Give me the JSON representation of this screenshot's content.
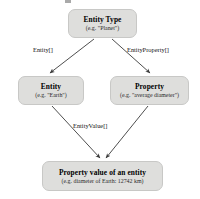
{
  "diagram": {
    "type": "flow-diagram",
    "background_color": "#ffffff",
    "node_fill_color": "#dededc",
    "node_border_color": "#c8c8c6",
    "edge_color": "#3a3a3a",
    "nodes": [
      {
        "id": "entity-type",
        "title": "Entity Type",
        "subtitle": "(e.g. \"Planet\")"
      },
      {
        "id": "entity",
        "title": "Entity",
        "subtitle": "(e.g. \"Earth\")"
      },
      {
        "id": "property",
        "title": "Property",
        "subtitle": "(e.g. \"average diameter\")"
      },
      {
        "id": "property-value",
        "title": "Property value of an entity",
        "subtitle": "(e.g. diameter of Earth: 12742 km)"
      }
    ],
    "edges": [
      {
        "id": "entity-type-to-entity",
        "from": "entity-type",
        "to": "entity",
        "label": "Entity[]"
      },
      {
        "id": "entity-type-to-property",
        "from": "entity-type",
        "to": "property",
        "label": "EntityProperty[]"
      },
      {
        "id": "entity-to-property-value",
        "from": "entity",
        "to": "property-value",
        "label": "EntityValue[]"
      },
      {
        "id": "property-to-property-value",
        "from": "property",
        "to": "property-value",
        "label": ""
      }
    ]
  }
}
